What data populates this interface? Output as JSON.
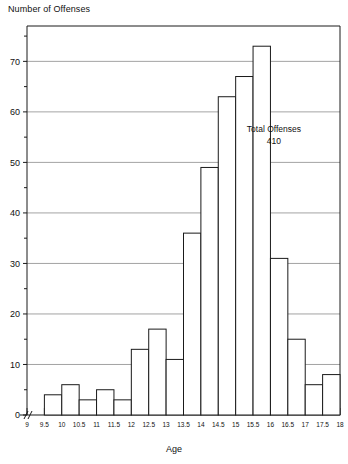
{
  "chart_data": {
    "type": "bar",
    "title": "",
    "ylabel": "Number of Offenses",
    "xlabel": "Age",
    "grid": true,
    "legend": false,
    "axis_break_x": true,
    "xlim": [
      9,
      18
    ],
    "ylim": [
      0,
      77
    ],
    "bin_width": 0.5,
    "y_ticks_major": [
      0,
      10,
      20,
      30,
      40,
      50,
      60,
      70
    ],
    "y_ticks_minor": [
      5,
      15,
      25,
      35,
      45,
      55,
      65,
      75
    ],
    "x_ticks": [
      "9",
      "9.5",
      "10",
      "10.5",
      "11",
      "11.5",
      "12",
      "12.5",
      "13",
      "13.5",
      "14",
      "14.5",
      "15",
      "15.5",
      "16",
      "16.5",
      "17",
      "17.5",
      "18"
    ],
    "categories": [
      "9-9.5",
      "9.5-10",
      "10-10.5",
      "10.5-11",
      "11-11.5",
      "11.5-12",
      "12-12.5",
      "12.5-13",
      "13-13.5",
      "13.5-14",
      "14-14.5",
      "14.5-15",
      "15-15.5",
      "15.5-16",
      "16-16.5",
      "16.5-17",
      "17-17.5",
      "17.5-18"
    ],
    "bin_starts": [
      9,
      9.5,
      10,
      10.5,
      11,
      11.5,
      12,
      12.5,
      13,
      13.5,
      14,
      14.5,
      15,
      15.5,
      16,
      16.5,
      17,
      17.5
    ],
    "values": [
      0,
      4,
      6,
      3,
      5,
      3,
      13,
      17,
      11,
      36,
      49,
      63,
      67,
      73,
      31,
      15,
      6,
      8
    ],
    "annotations": [
      {
        "line1": "Total Offenses",
        "line2": "410",
        "x": 16.1,
        "y": 56
      }
    ],
    "colors": {
      "bar_fill": "#ffffff",
      "bar_stroke": "#1a1a1a",
      "grid": "#8c8c8c",
      "axis": "#1a1a1a",
      "text": "#111111"
    }
  },
  "labels": {
    "y_axis_title": "Number of Offenses",
    "x_axis_title": "Age"
  }
}
